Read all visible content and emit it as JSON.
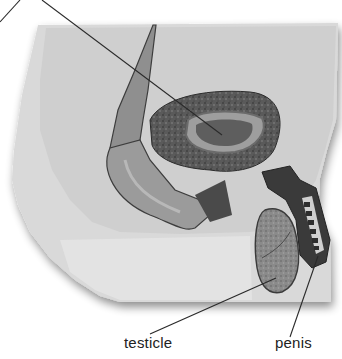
{
  "diagram": {
    "labels": [
      {
        "id": "unlabeled-top",
        "text": ""
      },
      {
        "id": "testicle",
        "text": "testicle"
      },
      {
        "id": "penis",
        "text": "penis"
      }
    ]
  }
}
